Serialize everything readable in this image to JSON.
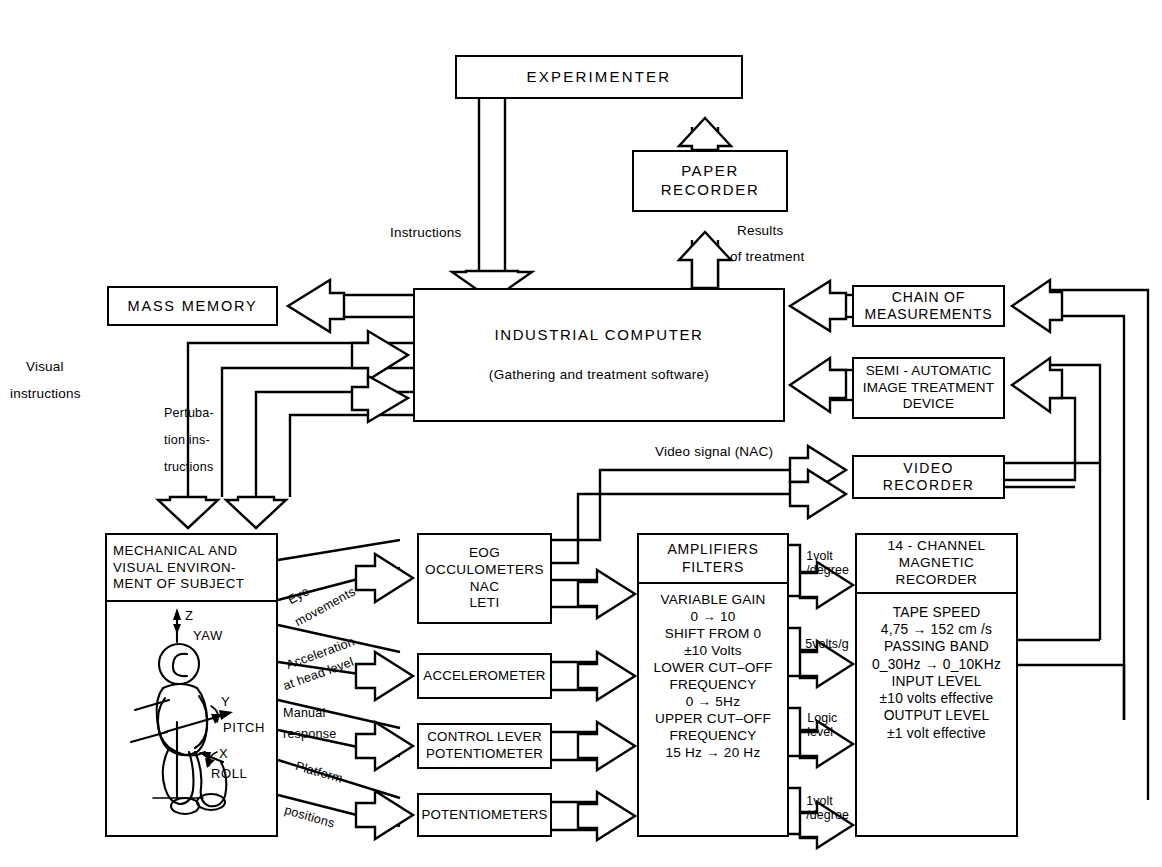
{
  "diagram": {
    "line_color": "#000000",
    "background": "#ffffff"
  },
  "boxes": {
    "experimenter": {
      "label": "EXPERIMENTER"
    },
    "paper_recorder": {
      "line1": "PAPER",
      "line2": "RECORDER"
    },
    "industrial_computer": {
      "title": "INDUSTRIAL  COMPUTER",
      "subtitle": "(Gathering and treatment software)"
    },
    "mass_memory": {
      "label": "MASS  MEMORY"
    },
    "chain_of_measurements": {
      "line1": "CHAIN OF",
      "line2": "MEASUREMENTS"
    },
    "semi_automatic": {
      "line1": "SEMI - AUTOMATIC",
      "line2": "IMAGE TREATMENT",
      "line3": "DEVICE"
    },
    "video_recorder": {
      "line1": "VIDEO",
      "line2": "RECORDER"
    },
    "subject": {
      "line1": "MECHANICAL  AND",
      "line2": "VISUAL ENVIRON-",
      "line3": "MENT OF SUBJECT",
      "axes": {
        "z": "Z",
        "z_name": "YAW",
        "y": "Y",
        "y_name": "PITCH",
        "x": "X",
        "x_name": "ROLL"
      }
    },
    "eog": {
      "line1": "EOG",
      "line2": "OCCULOMETERS",
      "line3": "NAC",
      "line4": "LETI"
    },
    "accelerometer": {
      "label": "ACCELEROMETER"
    },
    "control_lever": {
      "line1": "CONTROL LEVER",
      "line2": "POTENTIOMETER"
    },
    "potentiometers": {
      "label": "POTENTIOMETERS"
    },
    "amplifiers": {
      "header1": "AMPLIFIERS",
      "header2": "FILTERS",
      "specs": [
        "VARIABLE GAIN",
        "0 → 10",
        "SHIFT FROM  0",
        "±10 Volts",
        "LOWER CUT–OFF",
        "FREQUENCY",
        "0 → 5Hz",
        "UPPER CUT–OFF",
        "FREQUENCY",
        "15 Hz → 20 Hz"
      ]
    },
    "magnetic_recorder": {
      "header1": "14 - CHANNEL",
      "header2": "MAGNETIC",
      "header3": "RECORDER",
      "specs": [
        "TAPE SPEED",
        "4,75 → 152 cm /s",
        "PASSING BAND",
        "0_30Hz → 0_10KHz",
        "INPUT LEVEL",
        "±10 volts effective",
        "OUTPUT LEVEL",
        "±1 volt effective"
      ]
    }
  },
  "edge_labels": {
    "instructions": "Instructions",
    "results_of_treatment_1": "Results",
    "results_of_treatment_2": "of treatment",
    "visual_instructions_1": "Visual",
    "visual_instructions_2": "instructions",
    "pertubation_1": "Pertuba-",
    "pertubation_2": "tion ins-",
    "pertubation_3": "tructions",
    "video_signal": "Video signal (NAC)",
    "eye_movements_1": "Eye",
    "eye_movements_2": "movements",
    "acceleration_1": "Acceleration",
    "acceleration_2": "at head level",
    "manual_1": "Manual",
    "manual_2": "response",
    "platform_1": "Platform",
    "platform_2": "positions"
  },
  "signal_levels": [
    {
      "line1": "1volt",
      "line2": "/degree"
    },
    {
      "line1": "5volts/g",
      "line2": ""
    },
    {
      "line1": "Logic",
      "line2": "level"
    },
    {
      "line1": "1volt",
      "line2": "/degree"
    }
  ]
}
